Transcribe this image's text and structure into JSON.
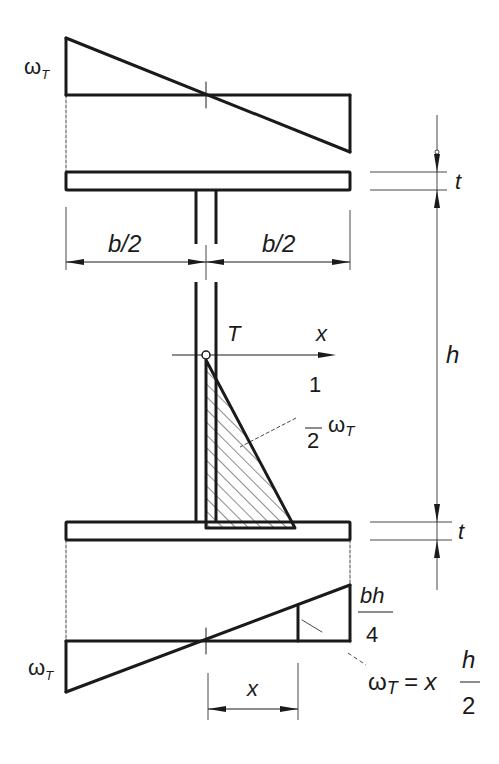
{
  "diagram": {
    "colors": {
      "line": "#1a1a1a",
      "background": "#ffffff"
    },
    "labels": {
      "omega_top": "ω",
      "omega_top_sub": "T",
      "omega_bottom": "ω",
      "omega_bottom_sub": "T",
      "half_width_left": "b/2",
      "half_width_right": "b/2",
      "flange_thickness_top": "t",
      "flange_thickness_bottom": "t",
      "height": "h",
      "shear_centre": "T",
      "x_axis": "x",
      "half_omega_num": "1",
      "half_omega_den": "2",
      "half_omega_symbol": "ω",
      "half_omega_sub": "T",
      "max_value_num": "bh",
      "max_value_den": "4",
      "formula_lhs": "ω",
      "formula_lhs_sub": "T",
      "formula_eq": "= x",
      "formula_num": "h",
      "formula_den": "2",
      "x_dimension": "x"
    }
  }
}
